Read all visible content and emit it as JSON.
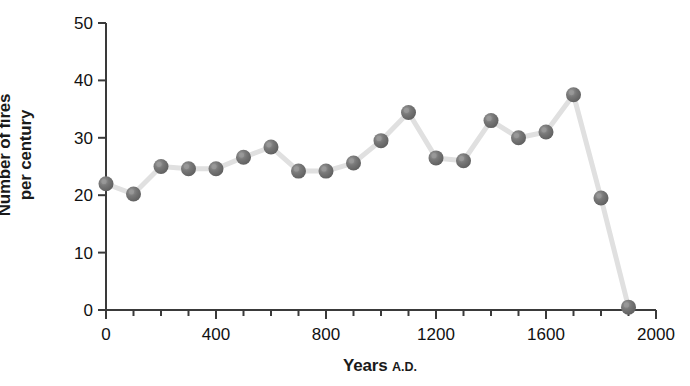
{
  "chart_data": {
    "type": "line",
    "title": "",
    "xlabel": "Years",
    "xlabel_suffix": "A.D.",
    "ylabel_line1": "Number of fires",
    "ylabel_line2": "per century",
    "ylabel": "Number of fires per century",
    "x": [
      0,
      100,
      200,
      300,
      400,
      500,
      600,
      700,
      800,
      900,
      1000,
      1100,
      1200,
      1300,
      1400,
      1500,
      1600,
      1700,
      1800,
      1900
    ],
    "values": [
      22,
      20.2,
      25,
      24.6,
      24.6,
      26.6,
      28.4,
      24.2,
      24.2,
      25.6,
      29.5,
      34.4,
      26.5,
      26,
      33,
      30,
      31,
      37.5,
      19.5,
      0.5
    ],
    "xlim": [
      0,
      2000
    ],
    "ylim": [
      0,
      50
    ],
    "x_major_ticks": [
      0,
      400,
      800,
      1200,
      1600,
      2000
    ],
    "x_major_tick_labels": [
      "0",
      "400",
      "800",
      "1200",
      "1600",
      "2000"
    ],
    "x_minor_tick_interval": 100,
    "y_ticks": [
      0,
      10,
      20,
      30,
      40,
      50
    ],
    "y_tick_labels": [
      "0",
      "10",
      "20",
      "30",
      "40",
      "50"
    ],
    "grid": false,
    "legend": null,
    "marker_color": "#6e6e6e",
    "marker_highlight_color": "#9a9a9a",
    "line_color": "#e0e0e0",
    "axis_color": "#3a3a3a"
  }
}
